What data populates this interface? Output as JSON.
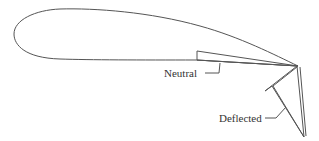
{
  "figure": {
    "labels": {
      "neutral": "Neutral",
      "deflected": "Deflected"
    },
    "colors": {
      "stroke": "#555555",
      "text": "#333333",
      "background": "#ffffff"
    }
  }
}
